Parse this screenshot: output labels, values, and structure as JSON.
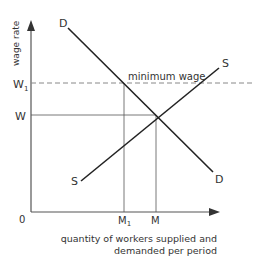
{
  "diagram": {
    "type": "labour-market-minimum-wage",
    "y_axis_label": "wage rate",
    "x_axis_label_line1": "quantity of workers supplied and",
    "x_axis_label_line2": "demanded per period",
    "origin_label": "0",
    "y_ticks": {
      "w1": "W",
      "w1_sub": "1",
      "w": "W"
    },
    "x_ticks": {
      "m1": "M",
      "m1_sub": "1",
      "m": "M"
    },
    "annotation": "minimum wage",
    "curves": {
      "demand_label_top": "D",
      "demand_label_bottom": "D",
      "supply_label_top": "S",
      "supply_label_bottom": "S"
    },
    "colors": {
      "axis": "#333333",
      "curve": "#222222",
      "guide": "#555555",
      "dashed": "#888888"
    }
  }
}
